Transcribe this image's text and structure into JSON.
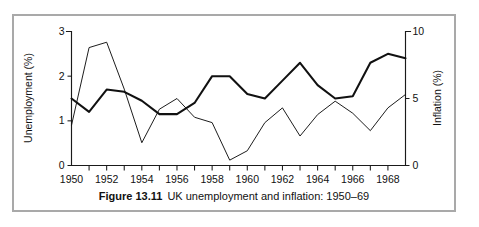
{
  "figure": {
    "caption_label": "Figure 13.11",
    "caption_text": "UK unemployment and inflation: 1950–69",
    "frame_color": "#a9a9a9",
    "line_color": "#111111"
  },
  "chart_data": {
    "type": "line",
    "title": "UK unemployment and inflation: 1950–69",
    "xlabel": "",
    "ylabel": "Unemployment (%)",
    "y2label": "Inflation (%)",
    "grid": false,
    "legend_position": "none",
    "x": [
      1950,
      1951,
      1952,
      1953,
      1954,
      1955,
      1956,
      1957,
      1958,
      1959,
      1960,
      1961,
      1962,
      1963,
      1964,
      1965,
      1966,
      1967,
      1968,
      1969
    ],
    "xlim": [
      1950,
      1969
    ],
    "xticks_major": [
      1950,
      1952,
      1954,
      1956,
      1958,
      1960,
      1962,
      1964,
      1966,
      1968
    ],
    "xtick_labels": [
      "1950",
      "1952",
      "1954",
      "1956",
      "1958",
      "1960",
      "1962",
      "1964",
      "1966",
      "1968"
    ],
    "ylim": [
      0,
      3
    ],
    "yticks": [
      0,
      1,
      2,
      3
    ],
    "ytick_labels": [
      "0",
      "1",
      "2",
      "3"
    ],
    "y2lim": [
      0,
      10
    ],
    "y2ticks": [
      0,
      5,
      10
    ],
    "y2tick_labels": [
      "0",
      "5",
      "10"
    ],
    "series": [
      {
        "name": "Unemployment (%)",
        "axis": "left",
        "line_weight": "thick",
        "values": [
          1.5,
          1.2,
          1.7,
          1.65,
          1.45,
          1.15,
          1.15,
          1.4,
          2.0,
          2.0,
          1.6,
          1.5,
          1.9,
          2.3,
          1.8,
          1.5,
          1.55,
          2.3,
          2.5,
          2.4
        ]
      },
      {
        "name": "Inflation (%)",
        "axis": "right",
        "line_weight": "thin",
        "values": [
          3.0,
          8.8,
          9.2,
          5.7,
          1.7,
          4.2,
          5.0,
          3.6,
          3.2,
          0.4,
          1.1,
          3.2,
          4.3,
          2.2,
          3.8,
          4.8,
          3.9,
          2.6,
          4.3,
          5.3
        ]
      }
    ]
  }
}
